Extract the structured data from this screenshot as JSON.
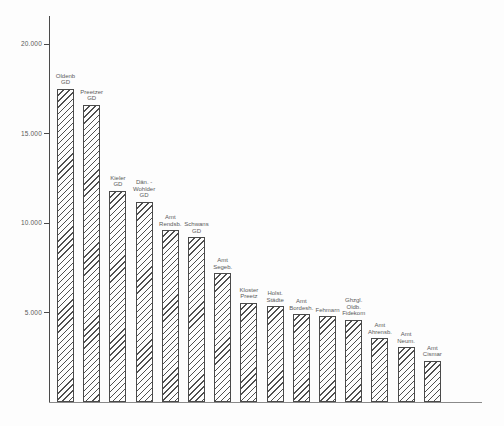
{
  "page": {
    "background": "#fdfdfd",
    "colors": {
      "axis": "#4a4a4a",
      "baseline": "#8a8a8a",
      "text": "#5a5a5a",
      "hatch_line": "#4f4f4f",
      "bar_fill": "#fdfdfd"
    }
  },
  "chart_data": {
    "type": "bar",
    "title": "",
    "xlabel": "",
    "ylabel": "",
    "grid": false,
    "legend": false,
    "bar_style": {
      "fill": "diagonal-hatch",
      "hatch_direction": "/",
      "outline": "#4a4a4a"
    },
    "ylim": [
      0,
      21500
    ],
    "y_ticks": [
      {
        "value": 5000,
        "label": "5.000"
      },
      {
        "value": 10000,
        "label": "10.000"
      },
      {
        "value": 15000,
        "label": "15.000"
      },
      {
        "value": 20000,
        "label": "20.000"
      }
    ],
    "categories": [
      [
        "Oldenb",
        "GD"
      ],
      [
        "Preetzer",
        "GD"
      ],
      [
        "Kieler",
        "GD"
      ],
      [
        "Dän. -",
        "Wohlder",
        "GD"
      ],
      [
        "Amt",
        "Rendsb."
      ],
      [
        "Schwans",
        "GD"
      ],
      [
        "Amt",
        "Segeb."
      ],
      [
        "Kloster",
        "Preetz"
      ],
      [
        "Holst.",
        "Städte"
      ],
      [
        "Amt",
        "Bordesh."
      ],
      [
        "Fehmarn"
      ],
      [
        "Ghzgl.",
        "Oldb.",
        "Fidekom"
      ],
      [
        "Amt",
        "Ahrensb."
      ],
      [
        "Amt",
        "Neum."
      ],
      [
        "Amt",
        "Cismar"
      ]
    ],
    "values": [
      17500,
      16600,
      11800,
      11200,
      9600,
      9200,
      7200,
      5550,
      5350,
      4900,
      4800,
      4600,
      3550,
      3050,
      2300
    ]
  }
}
